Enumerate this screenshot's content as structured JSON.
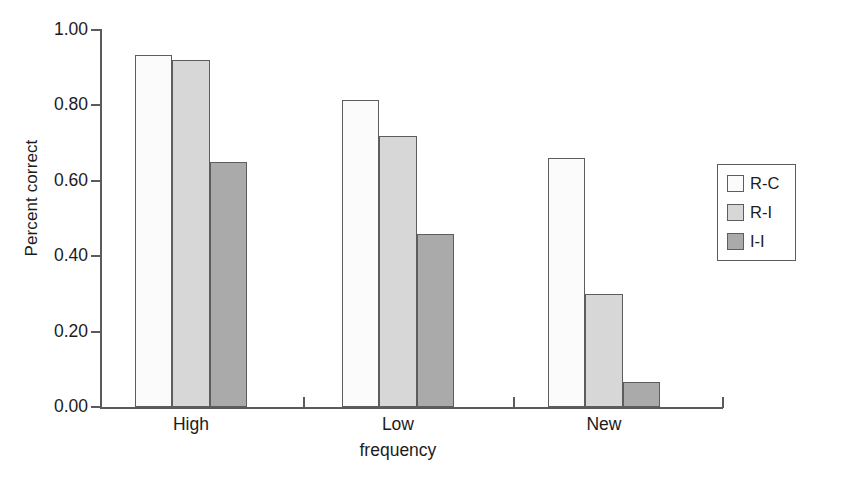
{
  "chart_data": {
    "type": "bar",
    "title": "",
    "xlabel": "frequency",
    "ylabel": "Percent correct",
    "categories": [
      "High",
      "Low",
      "New"
    ],
    "series": [
      {
        "name": "R-C",
        "color": "#fbfbfb",
        "values": [
          0.935,
          0.815,
          0.66
        ]
      },
      {
        "name": "R-I",
        "color": "#d7d7d7",
        "values": [
          0.92,
          0.72,
          0.3
        ]
      },
      {
        "name": "I-I",
        "color": "#aaaaaa",
        "values": [
          0.65,
          0.46,
          0.065
        ]
      }
    ],
    "ylim": [
      0.0,
      1.0
    ],
    "ytick_labels": [
      "1.00",
      "0.80",
      "0.60",
      "0.40",
      "0.20",
      "0.00"
    ],
    "ytick_values": [
      1.0,
      0.8,
      0.6,
      0.4,
      0.2,
      0.0
    ],
    "grid": false,
    "legend_position": "right"
  },
  "legend": {
    "items": [
      {
        "label": "R-C"
      },
      {
        "label": "R-I"
      },
      {
        "label": "I-I"
      }
    ]
  }
}
